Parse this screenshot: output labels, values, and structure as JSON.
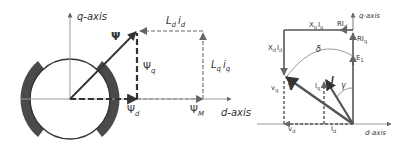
{
  "left_diagram": {
    "q_axis_label": "q-axis",
    "d_axis_label": "d-axis",
    "psi_label": "Ψ",
    "psi_q_label": "Ψ",
    "psi_q_sub": "q",
    "psi_d_label": "Ψ",
    "psi_d_sub": "d",
    "psi_m_label": "Ψ",
    "psi_m_sub": "M",
    "ldid_label_l": "L",
    "ldid_sub_d": "d",
    "ldid_label_i": "i",
    "ldid_sub_d2": "d",
    "lqiq_label_l": "L",
    "lqiq_sub_q": "q",
    "lqiq_label_i": "i",
    "lqiq_sub_q2": "q"
  },
  "right_diagram": {
    "q_axis_label": "q-axis",
    "d_axis_label": "d-axis",
    "xqiq_label": "X",
    "xqiq_sub": "q",
    "xqiq_i": "I",
    "xqiq_isub": "q",
    "xdid_label": "X",
    "xdid_sub": "d",
    "xdid_i": "I",
    "xdid_isub": "d",
    "rid_label": "RI",
    "rid_sub": "d",
    "riq_label": "RI",
    "riq_sub": "q",
    "e1_label": "E",
    "e1_sub": "1",
    "delta_label": "δ",
    "v_label": "V",
    "vq_label": "v",
    "vq_sub": "q",
    "vd_label": "v",
    "vd_sub": "d",
    "i_label": "I",
    "iq_label": "I",
    "iq_sub": "q",
    "id_label": "I",
    "id_sub": "d",
    "gamma_label": "γ"
  },
  "colors": {
    "magnet": "#4a4a4a",
    "axis": "#888888",
    "vector": "#444444",
    "dashed": "#999999",
    "dark_dashed": "#333333"
  }
}
